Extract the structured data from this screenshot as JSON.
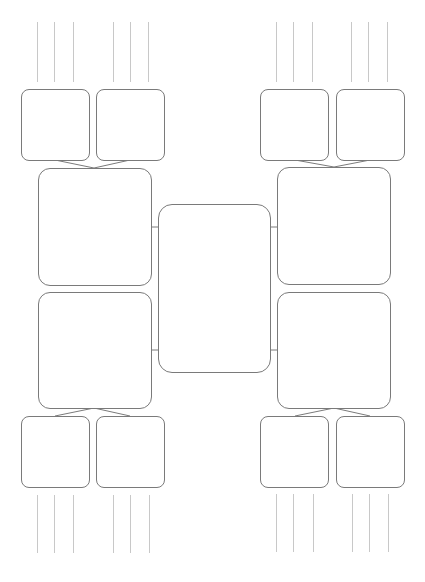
{
  "diagram": {
    "type": "double-bubble-tree-organizer",
    "center": {
      "label": ""
    },
    "branches": [
      {
        "id": "top-left",
        "main": {
          "label": ""
        },
        "children": [
          {
            "label": ""
          },
          {
            "label": ""
          }
        ],
        "detail_lines_per_child": 3
      },
      {
        "id": "bottom-left",
        "main": {
          "label": ""
        },
        "children": [
          {
            "label": ""
          },
          {
            "label": ""
          }
        ],
        "detail_lines_per_child": 3
      },
      {
        "id": "top-right",
        "main": {
          "label": ""
        },
        "children": [
          {
            "label": ""
          },
          {
            "label": ""
          }
        ],
        "detail_lines_per_child": 3
      },
      {
        "id": "bottom-right",
        "main": {
          "label": ""
        },
        "children": [
          {
            "label": ""
          },
          {
            "label": ""
          }
        ],
        "detail_lines_per_child": 3
      }
    ]
  },
  "colors": {
    "box_border": "#7a7a7a",
    "detail_line": "#c8c8c8",
    "connector": "#7a7a7a",
    "background": "#ffffff"
  }
}
